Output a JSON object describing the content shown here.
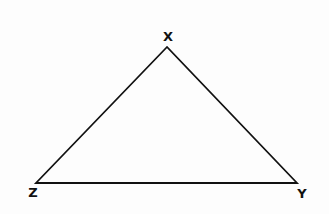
{
  "diagram": {
    "type": "triangle",
    "vertices": [
      {
        "label": "X",
        "x": 167,
        "y": 47,
        "label_x": 168,
        "label_y": 41
      },
      {
        "label": "Z",
        "x": 36,
        "y": 183,
        "label_x": 33,
        "label_y": 197
      },
      {
        "label": "Y",
        "x": 297,
        "y": 183,
        "label_x": 302,
        "label_y": 198
      }
    ],
    "stroke_color": "#111111"
  }
}
